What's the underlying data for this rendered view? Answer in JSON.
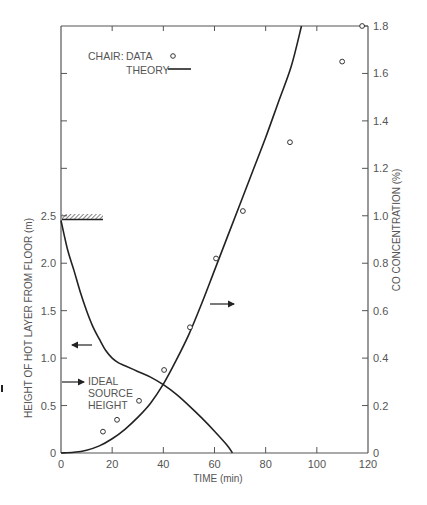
{
  "chart_data": {
    "type": "line",
    "title": "",
    "xlabel": "TIME (min)",
    "ylabel_left": "HEIGHT OF HOT LAYER FROM FLOOR (m)",
    "ylabel_right": "CO CONCENTRATION (%)",
    "xlim": [
      0,
      120
    ],
    "ylim_left": [
      0,
      3.8
    ],
    "ylim_right": [
      0,
      1.8
    ],
    "x_ticks": [
      0,
      20,
      40,
      60,
      80,
      100,
      120
    ],
    "y_left_ticks": [
      0,
      0.5,
      1.0,
      1.5,
      2.0,
      2.5
    ],
    "y_right_ticks": [
      0,
      0.2,
      0.4,
      0.6,
      0.8,
      1.0,
      1.2,
      1.4,
      1.6,
      1.8
    ],
    "grid": false,
    "legend": {
      "position": "upper-left",
      "title": "CHAIR:",
      "entries": [
        {
          "label": "DATA",
          "marker": "open-circle"
        },
        {
          "label": "THEORY",
          "marker": "solid-line"
        }
      ]
    },
    "series": [
      {
        "name": "CO concentration - DATA",
        "axis": "right",
        "style": "open-circle",
        "x": [
          16.4,
          21.9,
          30.5,
          40.3,
          50.4,
          60.6,
          71.1,
          89.5,
          109.9,
          117.7
        ],
        "y": [
          0.09,
          0.14,
          0.22,
          0.35,
          0.53,
          0.82,
          1.02,
          1.31,
          1.65,
          1.8
        ]
      },
      {
        "name": "CO concentration - THEORY",
        "axis": "right",
        "style": "solid-line",
        "x": [
          0,
          5,
          10,
          15,
          20,
          25,
          30,
          35,
          40,
          45,
          50,
          55,
          60,
          65,
          70,
          75,
          80,
          85,
          90,
          94
        ],
        "y": [
          0,
          0.003,
          0.012,
          0.03,
          0.06,
          0.1,
          0.15,
          0.21,
          0.29,
          0.39,
          0.5,
          0.63,
          0.77,
          0.91,
          1.05,
          1.19,
          1.33,
          1.48,
          1.63,
          1.8
        ]
      },
      {
        "name": "Hot layer height - THEORY",
        "axis": "left",
        "style": "solid-line",
        "x": [
          0,
          2.5,
          5,
          7.5,
          10,
          12.5,
          15,
          17.5,
          20,
          22.5,
          25,
          30,
          35,
          40,
          45,
          50,
          55,
          60,
          65,
          67
        ],
        "y": [
          2.45,
          2.15,
          1.93,
          1.7,
          1.5,
          1.33,
          1.2,
          1.08,
          1.0,
          0.95,
          0.92,
          0.86,
          0.8,
          0.72,
          0.62,
          0.5,
          0.37,
          0.23,
          0.08,
          0
        ]
      }
    ],
    "annotations": [
      {
        "text": "IDEAL SOURCE HEIGHT",
        "lines": [
          "IDEAL",
          "SOURCE",
          "HEIGHT"
        ],
        "points_to": {
          "axis": "left",
          "y": 0.75
        }
      },
      {
        "text": "ceiling marker (hatched)",
        "axis": "left",
        "y": 2.5,
        "x_range": [
          0,
          16
        ]
      },
      {
        "text": "arrow left",
        "meaning": "height curve reads on left axis",
        "at": {
          "x": 10,
          "y_left": 1.15
        }
      },
      {
        "text": "arrow right",
        "meaning": "CO curve reads on right axis",
        "at": {
          "x": 60,
          "y_right": 0.58
        }
      }
    ]
  },
  "legend": {
    "title": "CHAIR:",
    "data_label": "DATA",
    "theory_label": "THEORY"
  },
  "axes": {
    "x_title": "TIME (min)",
    "y_left_title": "HEIGHT OF HOT LAYER FROM FLOOR (m)",
    "y_right_title": "CO CONCENTRATION (%)",
    "x_tick_labels": [
      "0",
      "20",
      "40",
      "60",
      "80",
      "100",
      "120"
    ],
    "y_left_tick_labels": [
      "0",
      "0.5",
      "1.0",
      "1.5",
      "2.0",
      "2.5"
    ],
    "y_right_tick_labels": [
      "0",
      "0.2",
      "0.4",
      "0.6",
      "0.8",
      "1.0",
      "1.2",
      "1.4",
      "1.6",
      "1.8"
    ]
  },
  "annotation": {
    "line1": "IDEAL",
    "line2": "SOURCE",
    "line3": "HEIGHT"
  },
  "colors": {
    "line": "#222222",
    "axis": "#555555",
    "text": "#555555"
  }
}
